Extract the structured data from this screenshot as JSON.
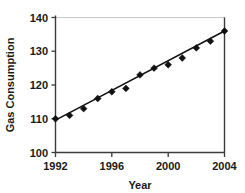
{
  "chart_data": {
    "type": "scatter",
    "title": "",
    "xlabel": "Year",
    "ylabel": "Gas Consumption",
    "x": [
      1992,
      1993,
      1994,
      1995,
      1996,
      1997,
      1998,
      1999,
      2000,
      2001,
      2002,
      2003,
      2004
    ],
    "values": [
      110,
      111,
      113,
      116,
      118,
      119,
      123,
      125,
      126,
      128,
      131,
      133,
      136
    ],
    "series": [
      {
        "name": "Gas Consumption",
        "values": [
          110,
          111,
          113,
          116,
          118,
          119,
          123,
          125,
          126,
          128,
          131,
          133,
          136
        ]
      }
    ],
    "trendline": {
      "shown": true,
      "start": [
        1992,
        109.6
      ],
      "end": [
        2004,
        136.0
      ]
    },
    "xlim": [
      1992,
      2004
    ],
    "ylim": [
      100,
      140
    ],
    "xticks": [
      1992,
      1996,
      2000,
      2004
    ],
    "xtick_labels": [
      "1992",
      "1996",
      "2000",
      "2004"
    ],
    "yticks": [
      100,
      110,
      120,
      130,
      140
    ],
    "ytick_labels": [
      "100",
      "110",
      "120",
      "130",
      "140"
    ],
    "grid": false,
    "legend": null,
    "marker": "diamond",
    "marker_color": "#111111",
    "line_color": "#111111",
    "axis_color": "#3b3b3b",
    "border_color": "#c8c8c8",
    "background": "#ffffff"
  },
  "axes": {
    "y_title": "Gas Consumption",
    "x_title": "Year",
    "y_labels": [
      "140",
      "130",
      "120",
      "110",
      "100"
    ],
    "x_labels": [
      "1992",
      "1996",
      "2000",
      "2004"
    ]
  }
}
